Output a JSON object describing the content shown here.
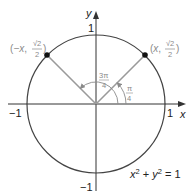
{
  "diagram": {
    "colors": {
      "circle": "#444444",
      "axes": "#333333",
      "radius": "#9a9a9a",
      "point": "#111111",
      "label_gray": "#8a8a8a",
      "label_dark": "#222222"
    },
    "axes": {
      "x_label": "x",
      "y_label": "y",
      "ticks": {
        "x_pos": "1",
        "x_neg": "−1",
        "y_pos": "1",
        "y_neg": "−1"
      }
    },
    "points": [
      {
        "name": "point-right",
        "label_open": "(",
        "label_var": "x",
        "label_sep": ", ",
        "sqrt": "√2",
        "den": "2",
        "label_close": ")"
      },
      {
        "name": "point-left",
        "label_open": "(",
        "label_var": "−x",
        "label_sep": ", ",
        "sqrt": "√2",
        "den": "2",
        "label_close": ")"
      }
    ],
    "angles": [
      {
        "name": "angle-pi-over-4",
        "num": "π",
        "den": "4"
      },
      {
        "name": "angle-3pi-over-4",
        "num": "3π",
        "den": "4"
      }
    ],
    "equation": {
      "x": "x",
      "x_exp": "2",
      "plus": " + ",
      "y": "y",
      "y_exp": "2",
      "equals": " = 1"
    }
  }
}
